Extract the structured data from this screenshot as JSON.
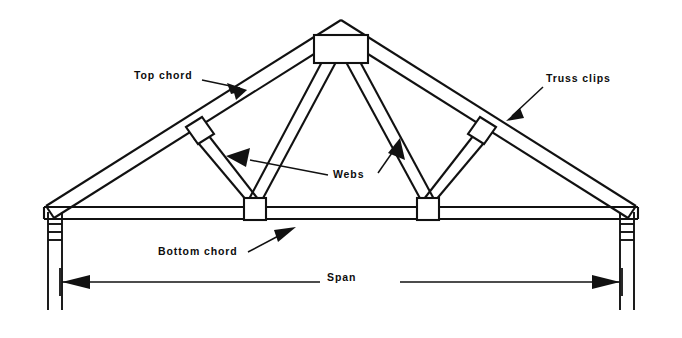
{
  "diagram": {
    "background_color": "#ffffff",
    "line_color": "#111111",
    "labels": {
      "top_chord": "Top chord",
      "truss_clips": "Truss clips",
      "webs": "Webs",
      "bottom_chord": "Bottom chord",
      "span": "Span"
    },
    "components": [
      {
        "name": "top-chord",
        "label": "Top chord",
        "count": 2,
        "description": "sloping upper members from eave to apex"
      },
      {
        "name": "bottom-chord",
        "label": "Bottom chord",
        "count": 1,
        "description": "horizontal tie member spanning wall to wall"
      },
      {
        "name": "webs",
        "label": "Webs",
        "count": 4,
        "description": "internal diagonal members between chords"
      },
      {
        "name": "truss-clips",
        "label": "Truss clips",
        "count": 2,
        "description": "small connector plates on the top chords"
      },
      {
        "name": "apex-gusset-plate",
        "label": "",
        "count": 1,
        "description": "rectangular plate at the ridge"
      },
      {
        "name": "joint-plate",
        "label": "",
        "count": 2,
        "description": "square nail plates at bottom chord web joints"
      },
      {
        "name": "supporting-wall",
        "label": "",
        "count": 2,
        "description": "vertical walls at each bearing"
      }
    ],
    "dimension": {
      "name": "span",
      "label": "Span",
      "arrow_style": "solid-filled-double-ended",
      "extent": "wall face to wall face"
    }
  }
}
